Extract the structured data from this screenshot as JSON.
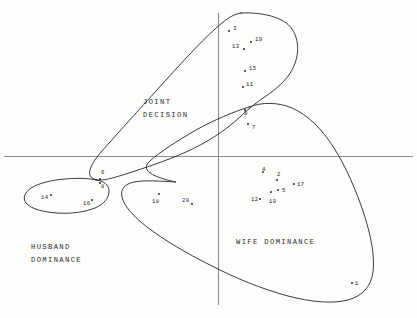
{
  "figure": {
    "type": "scatter-with-cluster-outlines",
    "axis_color": "#777777",
    "ink_color": "#2a2a2a",
    "background": "#fdfdfc"
  },
  "axes": {
    "horizontal": {
      "y": 156,
      "x1": 4,
      "x2": 413,
      "label": ""
    },
    "vertical": {
      "x": 218,
      "y1": 13,
      "y2": 305,
      "label": ""
    },
    "tick_labels": [],
    "grid": false
  },
  "regions": [
    {
      "id": "joint",
      "name": "joint-decision-region",
      "label": "JOINT\nDECISION",
      "label_x": 143,
      "label_y": 96,
      "lines": [
        "JOINT",
        "DECISION"
      ]
    },
    {
      "id": "husband",
      "name": "husband-dominance-region",
      "label": "HUSBAND\nDOMINANCE",
      "label_x": 31,
      "label_y": 241,
      "lines": [
        "HUSBAND",
        "DOMINANCE"
      ]
    },
    {
      "id": "wife",
      "name": "wife-dominance-region",
      "label": "WIFE DOMINANCE",
      "label_x": 236,
      "label_y": 236,
      "lines": [
        "WIFE DOMINANCE"
      ]
    }
  ],
  "chart_data": {
    "type": "scatter",
    "title": "",
    "xlabel": "",
    "ylabel": "",
    "grid": false,
    "legend": "none",
    "clusters": [
      "JOINT DECISION",
      "HUSBAND DOMINANCE",
      "WIFE DOMINANCE"
    ],
    "points": [
      {
        "label": "3",
        "x": 229,
        "y": 31,
        "lx": 233,
        "ly": 28,
        "cluster": "JOINT DECISION"
      },
      {
        "label": "19",
        "x": 251,
        "y": 42,
        "lx": 255,
        "ly": 39,
        "cluster": "JOINT DECISION"
      },
      {
        "label": "13",
        "x": 244,
        "y": 49,
        "lx": 232,
        "ly": 46,
        "cluster": "JOINT DECISION"
      },
      {
        "label": "15",
        "x": 245,
        "y": 71,
        "lx": 249,
        "ly": 68,
        "cluster": "JOINT DECISION"
      },
      {
        "label": "11",
        "x": 243,
        "y": 87,
        "lx": 246,
        "ly": 84,
        "cluster": "JOINT DECISION"
      },
      {
        "label": "9",
        "x": 245,
        "y": 110,
        "lx": 244,
        "ly": 113,
        "cluster": "WIFE DOMINANCE"
      },
      {
        "label": "7",
        "x": 248,
        "y": 124,
        "lx": 252,
        "ly": 127,
        "cluster": "WIFE DOMINANCE"
      },
      {
        "label": "6",
        "x": 100,
        "y": 179,
        "lx": 101,
        "ly": 172,
        "cluster": "HUSBAND DOMINANCE"
      },
      {
        "label": "8",
        "x": 100,
        "y": 183,
        "lx": 101,
        "ly": 186,
        "cluster": "HUSBAND DOMINANCE"
      },
      {
        "label": "14",
        "x": 51,
        "y": 195,
        "lx": 41,
        "ly": 197,
        "cluster": "HUSBAND DOMINANCE"
      },
      {
        "label": "16",
        "x": 92,
        "y": 200,
        "lx": 83,
        "ly": 203,
        "cluster": "HUSBAND DOMINANCE"
      },
      {
        "label": "4",
        "x": 263,
        "y": 172,
        "lx": 262,
        "ly": 169,
        "cluster": "WIFE DOMINANCE"
      },
      {
        "label": "2",
        "x": 277,
        "y": 180,
        "lx": 277,
        "ly": 174,
        "cluster": "WIFE DOMINANCE"
      },
      {
        "label": "5",
        "x": 278,
        "y": 190,
        "lx": 282,
        "ly": 190,
        "cluster": "WIFE DOMINANCE"
      },
      {
        "label": "17",
        "x": 294,
        "y": 184,
        "lx": 297,
        "ly": 184,
        "cluster": "WIFE DOMINANCE"
      },
      {
        "label": "12",
        "x": 260,
        "y": 199,
        "lx": 251,
        "ly": 199,
        "cluster": "WIFE DOMINANCE"
      },
      {
        "label": "10",
        "x": 271,
        "y": 192,
        "lx": 269,
        "ly": 201,
        "cluster": "WIFE DOMINANCE"
      },
      {
        "label": "18",
        "x": 159,
        "y": 194,
        "lx": 152,
        "ly": 201,
        "cluster": "WIFE DOMINANCE"
      },
      {
        "label": "20",
        "x": 192,
        "y": 204,
        "lx": 182,
        "ly": 200,
        "cluster": "WIFE DOMINANCE"
      },
      {
        "label": "1",
        "x": 352,
        "y": 283,
        "lx": 355,
        "ly": 283,
        "cluster": "WIFE DOMINANCE"
      }
    ]
  }
}
